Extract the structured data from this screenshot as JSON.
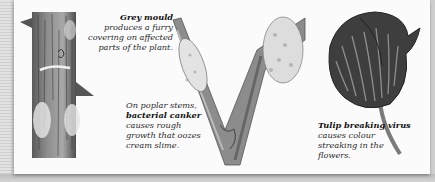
{
  "captions": {
    "grey_mould": {
      "bold": "Grey mould",
      "text": " produces a furry covering on affected parts of the plant."
    },
    "bacterial_canker": {
      "lead": "On poplar stems, ",
      "bold": "bacterial canker",
      "text": " causes rough growth that oozes cream slime."
    },
    "tulip_breaking": {
      "bold": "Tulip breaking virus",
      "text": " causes colour streaking in the flowers."
    }
  },
  "illustrations": [
    {
      "name": "rose-stem-grey-mould",
      "subject": "thorned stem with grey mould"
    },
    {
      "name": "poplar-stem-bacterial-canker",
      "subject": "forked poplar stem with canker growths"
    },
    {
      "name": "tulip-breaking-virus-flower",
      "subject": "streaked tulip flower"
    }
  ]
}
